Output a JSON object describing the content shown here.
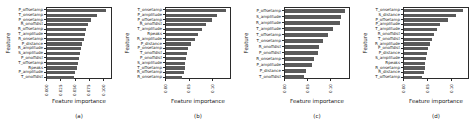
{
  "figure": {
    "background": "#ffffff",
    "frame_color": "#2b2b2b",
    "text_color": "#1a1a1a"
  },
  "chart_data": [
    {
      "type": "bar",
      "orientation": "horizontal",
      "xlabel": "Feature importance",
      "ylabel": "Feature",
      "caption": "(a)",
      "bar_color": "#5a5a5a",
      "grid": false,
      "xlim": [
        0,
        0.112
      ],
      "xticks": [
        "0.000",
        "0.025",
        "0.050",
        "0.075",
        "0.100"
      ],
      "xtick_values": [
        0,
        0.025,
        0.05,
        0.075,
        0.1
      ],
      "categories": [
        "P_offsetamp",
        "T_onsetamp",
        "P_onsetamp",
        "R_onoffdist",
        "R_offsetamp",
        "T_amplitude",
        "R_onsetamp",
        "P_distance",
        "R_amplitude",
        "S_amplitude",
        "P_onoffdist",
        "T_offsetamp",
        "Rpeaks",
        "P_amplitude",
        "T_onoffdist"
      ],
      "values": [
        0.104,
        0.088,
        0.077,
        0.071,
        0.068,
        0.066,
        0.064,
        0.062,
        0.06,
        0.058,
        0.056,
        0.054,
        0.052,
        0.049,
        0.047
      ]
    },
    {
      "type": "bar",
      "orientation": "horizontal",
      "xlabel": "Feature importance",
      "ylabel": "Feature",
      "caption": "(b)",
      "bar_color": "#5a5a5a",
      "grid": false,
      "xlim": [
        0,
        0.135
      ],
      "xticks": [
        "0.00",
        "0.05",
        "0.10"
      ],
      "xtick_values": [
        0,
        0.05,
        0.1
      ],
      "categories": [
        "T_onsetamp",
        "P_amplitude",
        "P_offsetamp",
        "R_onoffdist",
        "T_amplitude",
        "Rpeaks",
        "R_amplitude",
        "P_distance",
        "P_onsetamp",
        "T_onoffdist",
        "P_onoffdist",
        "S_amplitude",
        "T_offsetamp",
        "R_offsetamp",
        "R_onsetamp"
      ],
      "values": [
        0.127,
        0.107,
        0.097,
        0.085,
        0.075,
        0.067,
        0.061,
        0.052,
        0.047,
        0.044,
        0.042,
        0.041,
        0.04,
        0.038,
        0.033
      ]
    },
    {
      "type": "bar",
      "orientation": "horizontal",
      "xlabel": "Feature importance",
      "ylabel": "Feature",
      "caption": "(c)",
      "bar_color": "#5a5a5a",
      "grid": false,
      "xlim": [
        0,
        0.138
      ],
      "xticks": [
        "0.00",
        "0.05",
        "0.10"
      ],
      "xtick_values": [
        0,
        0.05,
        0.1
      ],
      "categories": [
        "P_offsetamp",
        "S_amplitude",
        "R_amplitude",
        "T_amplitude",
        "T_offsetamp",
        "T_onsetamp",
        "R_onoffdist",
        "P_onoffdist",
        "R_onsetamp",
        "P_amplitude",
        "P_distance",
        "T_onoffdist"
      ],
      "values": [
        0.13,
        0.121,
        0.118,
        0.103,
        0.092,
        0.082,
        0.074,
        0.071,
        0.063,
        0.058,
        0.045,
        0.04
      ]
    },
    {
      "type": "bar",
      "orientation": "horizontal",
      "xlabel": "Feature importance",
      "ylabel": "Feature",
      "caption": "(d)",
      "bar_color": "#5a5a5a",
      "grid": false,
      "xlim": [
        0,
        0.132
      ],
      "xticks": [
        "0.00",
        "0.05",
        "0.10"
      ],
      "xtick_values": [
        0,
        0.05,
        0.1
      ],
      "categories": [
        "T_onsetamp",
        "S_distance",
        "P_offsetamp",
        "P_amplitude",
        "T_amplitude",
        "R_onoffdist",
        "T_onoffdist",
        "R_amplitude",
        "P_onoffdist",
        "P_distance",
        "S_amplitude",
        "Rpeaks",
        "R_onsetamp",
        "R_distance",
        "T_offsetamp"
      ],
      "values": [
        0.122,
        0.108,
        0.09,
        0.075,
        0.068,
        0.062,
        0.058,
        0.053,
        0.049,
        0.047,
        0.045,
        0.044,
        0.043,
        0.041,
        0.038
      ]
    }
  ]
}
